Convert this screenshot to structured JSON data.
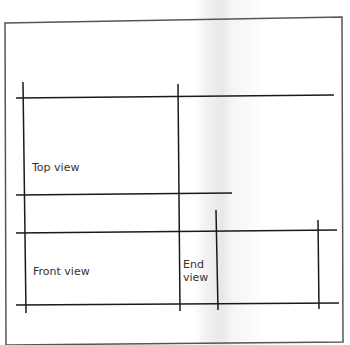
{
  "diagram": {
    "type": "orthographic-projection-layout",
    "labels": {
      "top_view": "Top view",
      "front_view": "Front view",
      "end_view_line1": "End",
      "end_view_line2": "view"
    },
    "colors": {
      "line": "#1a1a1a",
      "border": "#555555",
      "background": "#ffffff"
    }
  }
}
